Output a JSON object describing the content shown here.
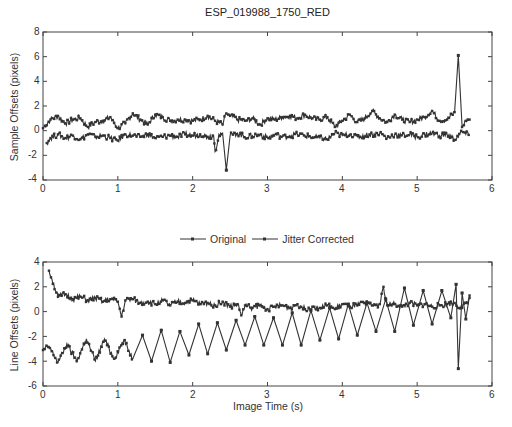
{
  "chart_data": [
    {
      "type": "line",
      "title": "ESP_019988_1750_RED",
      "xlabel": "",
      "ylabel": "Sample Offsets (pixels)",
      "xlim": [
        0,
        6
      ],
      "ylim": [
        -4,
        8
      ],
      "xticks": [
        0,
        1,
        2,
        3,
        4,
        5,
        6
      ],
      "yticks": [
        -4,
        -2,
        0,
        2,
        4,
        6,
        8
      ],
      "grid": false,
      "series": [
        {
          "name": "Original",
          "x": [
            0.0,
            0.1,
            0.2,
            0.3,
            0.4,
            0.5,
            0.6,
            0.7,
            0.8,
            0.9,
            1.0,
            1.1,
            1.2,
            1.3,
            1.4,
            1.5,
            1.6,
            1.7,
            1.8,
            1.9,
            2.0,
            2.1,
            2.2,
            2.3,
            2.4,
            2.45,
            2.5,
            2.6,
            2.7,
            2.8,
            2.9,
            3.0,
            3.1,
            3.2,
            3.3,
            3.4,
            3.5,
            3.6,
            3.7,
            3.8,
            3.9,
            4.0,
            4.1,
            4.2,
            4.3,
            4.4,
            4.5,
            4.6,
            4.7,
            4.8,
            4.9,
            5.0,
            5.1,
            5.2,
            5.3,
            5.4,
            5.5,
            5.55,
            5.6,
            5.65,
            5.7
          ],
          "values": [
            0.2,
            0.9,
            1.2,
            0.6,
            0.9,
            1.0,
            0.3,
            0.7,
            0.8,
            1.1,
            0.2,
            0.6,
            1.4,
            0.9,
            0.5,
            1.3,
            1.1,
            0.8,
            0.9,
            0.9,
            0.8,
            0.9,
            1.2,
            0.8,
            0.5,
            1.4,
            1.2,
            0.9,
            0.8,
            1.0,
            0.5,
            1.0,
            0.9,
            1.1,
            1.2,
            1.0,
            1.3,
            1.0,
            0.9,
            1.1,
            0.3,
            0.8,
            1.3,
            0.7,
            1.0,
            1.6,
            1.0,
            0.7,
            1.3,
            0.9,
            0.7,
            0.9,
            1.1,
            1.6,
            0.8,
            0.9,
            1.5,
            6.1,
            0.3,
            0.8,
            0.9
          ]
        },
        {
          "name": "Jitter Corrected",
          "x": [
            0.05,
            0.1,
            0.2,
            0.3,
            0.4,
            0.5,
            0.6,
            0.7,
            0.8,
            0.9,
            1.0,
            1.1,
            1.2,
            1.3,
            1.4,
            1.5,
            1.6,
            1.7,
            1.8,
            1.9,
            2.0,
            2.1,
            2.2,
            2.28,
            2.3,
            2.35,
            2.4,
            2.45,
            2.5,
            2.6,
            2.7,
            2.8,
            2.9,
            3.0,
            3.1,
            3.2,
            3.3,
            3.4,
            3.5,
            3.6,
            3.7,
            3.8,
            3.9,
            4.0,
            4.1,
            4.2,
            4.3,
            4.4,
            4.5,
            4.6,
            4.7,
            4.8,
            4.9,
            5.0,
            5.1,
            5.2,
            5.3,
            5.4,
            5.5,
            5.6,
            5.7
          ],
          "values": [
            -1.0,
            -0.6,
            -0.3,
            -0.6,
            -0.4,
            -0.7,
            -0.3,
            -0.5,
            -0.4,
            -0.6,
            -0.8,
            -0.3,
            -0.4,
            -0.5,
            -0.3,
            -0.6,
            -0.5,
            -0.4,
            -0.5,
            -0.3,
            -0.4,
            -0.3,
            -0.5,
            -0.4,
            -1.7,
            -0.3,
            -0.2,
            -3.2,
            -0.4,
            -0.2,
            -0.5,
            -0.4,
            -0.3,
            -0.6,
            -0.3,
            -0.5,
            -0.4,
            -0.3,
            -0.4,
            -0.5,
            -0.6,
            -0.7,
            -0.2,
            -0.4,
            -0.3,
            -0.5,
            -0.4,
            -0.3,
            -0.2,
            -0.6,
            -0.3,
            -0.4,
            -0.3,
            -0.5,
            -0.3,
            -0.2,
            -0.4,
            -0.3,
            -0.7,
            -0.1,
            -0.4
          ]
        }
      ]
    },
    {
      "type": "line",
      "title": "",
      "xlabel": "Image Time (s)",
      "ylabel": "Line Offsets (pixels)",
      "xlim": [
        0,
        6
      ],
      "ylim": [
        -6,
        4
      ],
      "xticks": [
        0,
        1,
        2,
        3,
        4,
        5,
        6
      ],
      "yticks": [
        -6,
        -4,
        -2,
        0,
        2,
        4
      ],
      "grid": false,
      "legend": {
        "position": "top-center",
        "entries": [
          "Original",
          "Jitter Corrected"
        ]
      },
      "series": [
        {
          "name": "Original",
          "x": [
            0.0,
            0.08,
            0.2,
            0.32,
            0.45,
            0.58,
            0.7,
            0.82,
            0.95,
            1.08,
            1.2,
            1.33,
            1.45,
            1.58,
            1.7,
            1.83,
            1.95,
            2.08,
            2.2,
            2.33,
            2.45,
            2.58,
            2.7,
            2.83,
            2.95,
            3.08,
            3.2,
            3.33,
            3.45,
            3.58,
            3.7,
            3.83,
            3.95,
            4.08,
            4.2,
            4.33,
            4.45,
            4.58,
            4.7,
            4.83,
            4.95,
            5.08,
            5.2,
            5.33,
            5.45,
            5.52,
            5.55,
            5.6,
            5.65,
            5.7
          ],
          "values": [
            -3.1,
            -2.8,
            -4.1,
            -2.6,
            -4.0,
            -2.2,
            -4.0,
            -2.2,
            -3.8,
            -2.3,
            -3.8,
            -1.9,
            -4.0,
            -1.5,
            -4.1,
            -1.6,
            -3.5,
            -1.0,
            -3.4,
            -0.9,
            -3.1,
            -0.7,
            -2.7,
            -0.4,
            -2.7,
            -0.5,
            -2.7,
            -0.1,
            -2.7,
            0.1,
            -2.3,
            0.3,
            -2.2,
            0.6,
            -1.9,
            0.7,
            -1.6,
            1.0,
            -1.6,
            1.9,
            -1.1,
            1.7,
            -1.0,
            1.7,
            -0.5,
            2.2,
            -4.6,
            1.5,
            -0.6,
            1.3
          ]
        },
        {
          "name": "Jitter Corrected",
          "x": [
            0.08,
            0.12,
            0.2,
            0.3,
            0.4,
            0.5,
            0.6,
            0.7,
            0.8,
            0.9,
            1.0,
            1.05,
            1.1,
            1.2,
            1.3,
            1.4,
            1.5,
            1.6,
            1.7,
            1.8,
            1.9,
            2.0,
            2.1,
            2.2,
            2.3,
            2.4,
            2.5,
            2.6,
            2.65,
            2.7,
            2.8,
            2.9,
            3.0,
            3.1,
            3.2,
            3.3,
            3.4,
            3.5,
            3.6,
            3.7,
            3.8,
            3.9,
            4.0,
            4.1,
            4.2,
            4.3,
            4.4,
            4.5,
            4.55,
            4.6,
            4.7,
            4.8,
            4.9,
            5.0,
            5.1,
            5.2,
            5.3,
            5.4,
            5.5,
            5.6,
            5.7
          ],
          "values": [
            3.3,
            2.6,
            1.2,
            1.4,
            1.0,
            1.2,
            0.9,
            1.1,
            0.8,
            1.0,
            0.8,
            -0.4,
            0.9,
            1.0,
            0.7,
            0.8,
            0.6,
            0.9,
            0.5,
            0.8,
            0.7,
            0.9,
            0.6,
            0.7,
            0.5,
            0.8,
            0.4,
            0.6,
            -0.3,
            0.5,
            0.3,
            0.5,
            0.2,
            0.4,
            0.5,
            0.3,
            0.6,
            0.2,
            0.4,
            0.3,
            0.5,
            0.2,
            0.6,
            0.4,
            0.5,
            0.7,
            0.5,
            0.6,
            2.0,
            0.5,
            0.6,
            0.4,
            0.7,
            0.5,
            0.6,
            0.4,
            0.5,
            0.6,
            0.7,
            0.3,
            1.1
          ]
        }
      ]
    }
  ],
  "figure": {
    "top_title": "ESP_019988_1750_RED",
    "top_ylabel": "Sample Offsets (pixels)",
    "bottom_ylabel": "Line Offsets (pixels)",
    "bottom_xlabel": "Image Time (s)",
    "legend": {
      "original": "Original",
      "corrected": "Jitter Corrected"
    },
    "top_xticks": [
      "0",
      "1",
      "2",
      "3",
      "4",
      "5",
      "6"
    ],
    "top_yticks": [
      "8",
      "6",
      "4",
      "2",
      "0",
      "-2",
      "-4"
    ],
    "bottom_xticks": [
      "0",
      "1",
      "2",
      "3",
      "4",
      "5",
      "6"
    ],
    "bottom_yticks": [
      "4",
      "2",
      "0",
      "-2",
      "-4",
      "-6"
    ],
    "colors": {
      "line": "#333333",
      "axis": "#444444",
      "background": "#ffffff"
    }
  }
}
